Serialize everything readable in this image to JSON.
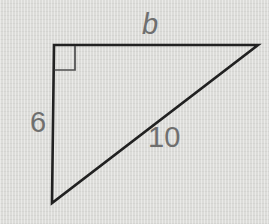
{
  "figure": {
    "type": "right-triangle-diagram",
    "labels": {
      "top_side": "b",
      "left_side": "6",
      "hypotenuse": "10"
    },
    "colors": {
      "background": "#dcdcd9",
      "line": "#212121",
      "marker": "#4d4d4d",
      "label_text": "#6f6f6f"
    }
  }
}
